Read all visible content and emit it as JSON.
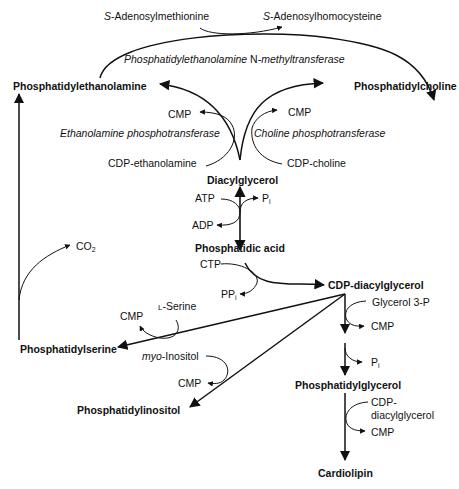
{
  "metabolites": {
    "sam": {
      "prefix": "S",
      "text": "-Adenosylmethionine"
    },
    "sah": {
      "prefix": "S",
      "text": "-Adenosylhomocysteine"
    },
    "pe": "Phosphatidylethanolamine",
    "pc": "Phosphatidylcholine",
    "cmp_left": "CMP",
    "cmp_right": "CMP",
    "cdp_ethanolamine": "CDP-ethanolamine",
    "cdp_choline": "CDP-choline",
    "dag": "Diacylglycerol",
    "atp": "ATP",
    "adp": "ADP",
    "pi_top": {
      "base": "P",
      "sub": "i"
    },
    "pa": "Phosphatidic acid",
    "ctp": "CTP",
    "ppi": {
      "base": "PP",
      "sub": "i"
    },
    "cdp_dag": "CDP-diacylglycerol",
    "co2": {
      "base": "CO",
      "sub": "2"
    },
    "l_serine": {
      "prefix": "L",
      "text": "-Serine"
    },
    "cmp_serine": "CMP",
    "ps": "Phosphatidylserine",
    "myo_inositol": {
      "prefix": "myo",
      "text": "-Inositol"
    },
    "cmp_inositol": "CMP",
    "pi_lipid": "Phosphatidylinositol",
    "glycerol_3p": "Glycerol 3-P",
    "cmp_glycerol": "CMP",
    "pi_pg": {
      "base": "P",
      "sub": "i"
    },
    "pg": "Phosphatidylglycerol",
    "cdp_dag2_line1": "CDP-",
    "cdp_dag2_line2": "diacylglycerol",
    "cmp_cardio": "CMP",
    "cardiolipin": "Cardiolipin"
  },
  "enzymes": {
    "pemt": {
      "part1": "Phosphatidylethanolamine ",
      "part2": "N",
      "part3": "-methyltransferase"
    },
    "ept": "Ethanolamine phosphotransferase",
    "cpt": "Choline phosphotransferase"
  },
  "colors": {
    "line": "#111111",
    "text": "#111111",
    "background": "#ffffff"
  }
}
